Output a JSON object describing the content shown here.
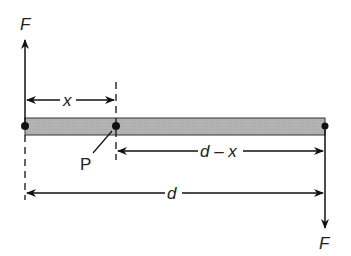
{
  "diagram": {
    "title": "",
    "labels": {
      "force_top": "F",
      "force_bottom": "F",
      "x": "x",
      "d_minus_x": "d – x",
      "d": "d",
      "point": "P"
    },
    "colors": {
      "bar_fill": "#b3b3b3",
      "line": "#111111"
    }
  }
}
